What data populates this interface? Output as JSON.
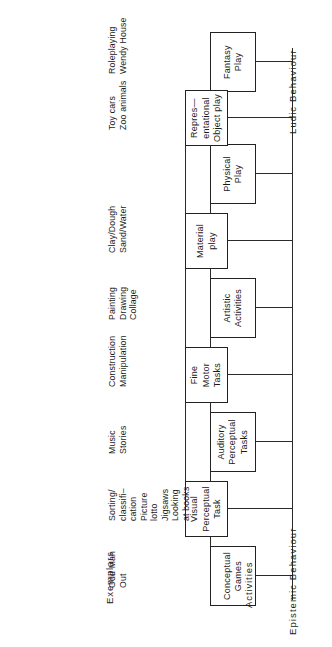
{
  "figure": {
    "type": "hierarchy-diagram",
    "axis_labels": {
      "left": "Epistemic Behaviour",
      "right": "Ludic Behaviour"
    },
    "row_labels": {
      "activities": "Activities",
      "exemplars": "Exemplars"
    },
    "nodes": [
      {
        "id": "conceptual-games",
        "label": "Conceptual\nGames",
        "column": 1
      },
      {
        "id": "visual-perceptual-task",
        "label": "Visual\nPerceptual\nTask",
        "column": 2
      },
      {
        "id": "auditory-perceptual",
        "label": "Auditory\nPerceptual\nTasks",
        "column": 1
      },
      {
        "id": "fine-motor-tasks",
        "label": "Fine\nMotor\nTasks",
        "column": 2
      },
      {
        "id": "artistic-activities",
        "label": "Artistic\nActivities",
        "column": 1
      },
      {
        "id": "material-play",
        "label": "Material\nplay",
        "column": 2
      },
      {
        "id": "physical-play",
        "label": "Physical\nPlay",
        "column": 1
      },
      {
        "id": "representational-play",
        "label": "Repres—\nentational\nObject play",
        "column": 2
      },
      {
        "id": "fantasy-play",
        "label": "Fantasy\nPlay",
        "column": 1
      }
    ],
    "exemplars": [
      {
        "id": "exemplar-conceptual-games",
        "text": "Odd Man\nOut"
      },
      {
        "id": "exemplar-visual-perceptual-task",
        "text": "Sorting/\nclassifi–\ncation\nPicture\nlotto\nJigsaws\nLooking\nat books"
      },
      {
        "id": "exemplar-auditory-perceptual",
        "text": "Music\nStories"
      },
      {
        "id": "exemplar-fine-motor-tasks",
        "text": "Construction\nManipulation"
      },
      {
        "id": "exemplar-artistic-activities",
        "text": "Painting\nDrawing\nCollage"
      },
      {
        "id": "exemplar-material-play",
        "text": "Clay/Dough\nSand/Water"
      },
      {
        "id": "exemplar-physical-play",
        "text": ""
      },
      {
        "id": "exemplar-representational-play",
        "text": "Toy cars\nZoo animals"
      },
      {
        "id": "exemplar-fantasy-play",
        "text": "Roleplaying\nWendy House"
      }
    ],
    "colors": {
      "ink": "#1a1a1a",
      "line": "#2a2a2a",
      "paper": "#ffffff"
    }
  }
}
